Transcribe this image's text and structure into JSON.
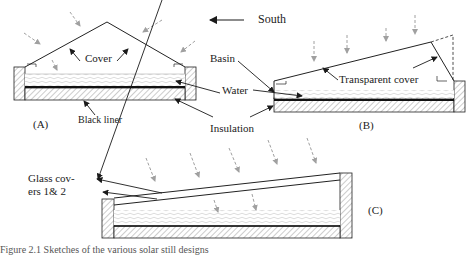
{
  "direction": {
    "label": "South",
    "arrow": "left-arrow"
  },
  "panel_a": {
    "id": "(A)",
    "labels": {
      "cover": "Cover",
      "black_liner": "Black liner"
    }
  },
  "panel_b": {
    "id": "(B)",
    "labels": {
      "basin": "Basin",
      "water": "Water",
      "transparent_cover": "Transparent cover"
    }
  },
  "shared_labels": {
    "insulation": "Insulation"
  },
  "panel_c": {
    "id": "(C)",
    "labels": {
      "glass_covers_line1": "Glass cov-",
      "glass_covers_line2": "ers 1& 2"
    }
  },
  "caption": "Figure 2.1  Sketches of the various solar still designs",
  "colors": {
    "line": "#1a1a1a",
    "ray": "#9a9a9a",
    "hatch": "#888888",
    "water": "#c8c8c8"
  }
}
